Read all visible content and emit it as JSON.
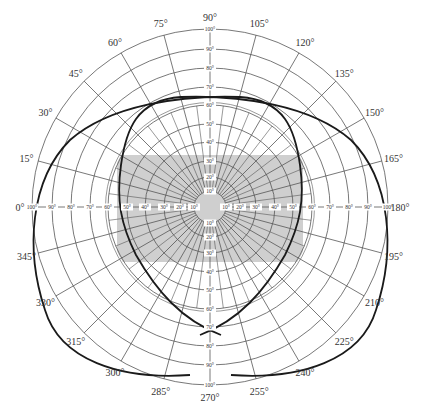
{
  "diagram": {
    "center": {
      "x": 210,
      "y": 207
    },
    "outer_radius": 178,
    "colors": {
      "grid": "#555555",
      "shaded_region": "#cfcfcf",
      "curve": "#1a1a1a",
      "label_bg": "#ffffff"
    },
    "azimuth_labels": [
      "0°",
      "15°",
      "30°",
      "45°",
      "60°",
      "75°",
      "90°",
      "105°",
      "120°",
      "135°",
      "150°",
      "165°",
      "180°",
      "195°",
      "210°",
      "225°",
      "240°",
      "255°",
      "270°",
      "285°",
      "300°",
      "315°",
      "330°",
      "345°"
    ],
    "azimuth_values": [
      0,
      15,
      30,
      45,
      60,
      75,
      90,
      105,
      120,
      135,
      150,
      165,
      180,
      195,
      210,
      225,
      240,
      255,
      270,
      285,
      300,
      315,
      330,
      345
    ],
    "outer_rings": [
      "60°",
      "70°",
      "80°",
      "90°",
      "100°"
    ],
    "outer_ring_values": [
      60,
      70,
      80,
      90,
      100
    ],
    "inner_rings": [
      "10°",
      "20°",
      "30°",
      "40°",
      "50°",
      "60°"
    ],
    "inner_ring_values": [
      10,
      20,
      30,
      40,
      50,
      60
    ],
    "shaded_region": {
      "x1": 117,
      "y1": 155,
      "x2": 303,
      "y2": 262,
      "clip_ring": 60
    },
    "curves": [
      {
        "name": "left-eye-field"
      },
      {
        "name": "right-eye-field"
      }
    ]
  }
}
